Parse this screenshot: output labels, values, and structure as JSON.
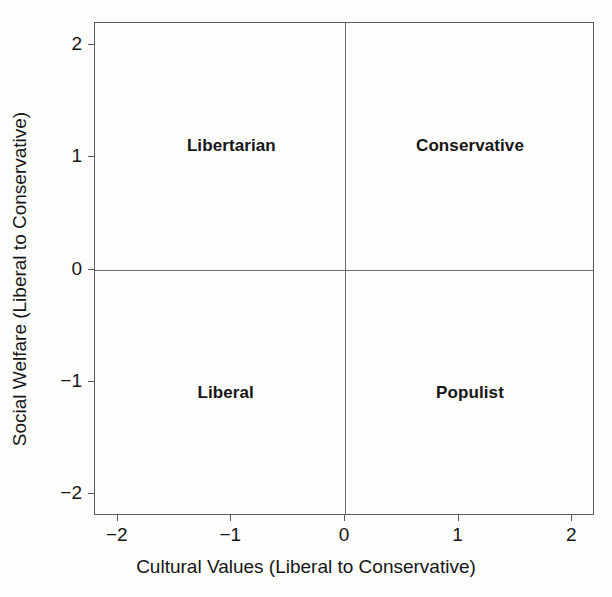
{
  "chart_data": {
    "type": "scatter",
    "title": "",
    "xlabel": "Cultural Values (Liberal to Conservative)",
    "ylabel": "Social Welfare (Liberal to Conservative)",
    "xlim": [
      -2.2,
      2.2
    ],
    "ylim": [
      -2.2,
      2.2
    ],
    "grid": false,
    "legend": "none",
    "x_ticks": [
      {
        "value": -2,
        "label": "−2"
      },
      {
        "value": -1,
        "label": "−1"
      },
      {
        "value": 0,
        "label": "0"
      },
      {
        "value": 1,
        "label": "1"
      },
      {
        "value": 2,
        "label": "2"
      }
    ],
    "y_ticks": [
      {
        "value": -2,
        "label": "−2"
      },
      {
        "value": -1,
        "label": "−1"
      },
      {
        "value": 0,
        "label": "0"
      },
      {
        "value": 1,
        "label": "1"
      },
      {
        "value": 2,
        "label": "2"
      }
    ],
    "reference_lines": [
      {
        "axis": "x",
        "value": 0
      },
      {
        "axis": "y",
        "value": 0
      }
    ],
    "annotations": [
      {
        "label": "Libertarian",
        "x": -1.0,
        "y": 1.1
      },
      {
        "label": "Conservative",
        "x": 1.1,
        "y": 1.1
      },
      {
        "label": "Liberal",
        "x": -1.05,
        "y": -1.1
      },
      {
        "label": "Populist",
        "x": 1.1,
        "y": -1.1
      }
    ],
    "quadrants": [
      {
        "name": "upper-left",
        "label": "Libertarian",
        "cultural": "liberal",
        "social_welfare": "conservative"
      },
      {
        "name": "upper-right",
        "label": "Conservative",
        "cultural": "conservative",
        "social_welfare": "conservative"
      },
      {
        "name": "lower-left",
        "label": "Liberal",
        "cultural": "liberal",
        "social_welfare": "liberal"
      },
      {
        "name": "lower-right",
        "label": "Populist",
        "cultural": "conservative",
        "social_welfare": "liberal"
      }
    ],
    "colors": {
      "background": "#fdfdfc",
      "axis": "#5c5c5c",
      "reference_line": "#6a6a6a",
      "text": "#161616"
    }
  }
}
